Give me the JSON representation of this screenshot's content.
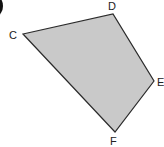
{
  "figure": {
    "shape": "quadrilateral",
    "fill_color": "#c9c9c9",
    "stroke_color": "#2b2b2b",
    "vertices": [
      {
        "label": "C",
        "x": 23,
        "y": 34
      },
      {
        "label": "D",
        "x": 113,
        "y": 14
      },
      {
        "label": "E",
        "x": 154,
        "y": 81
      },
      {
        "label": "F",
        "x": 115,
        "y": 132
      }
    ]
  },
  "labels": {
    "C": "C",
    "D": "D",
    "E": "E",
    "F": "F"
  }
}
